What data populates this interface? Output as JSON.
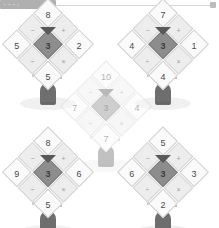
{
  "topbar": {
    "progress_label": "• • • |",
    "progress_percent": 26,
    "handle_name": "slider-handle"
  },
  "board": {
    "title": "Windmill arithmetic puzzle board",
    "operators": {
      "plus": "+",
      "minus": "−",
      "times": "×",
      "divide": "÷"
    },
    "windmills": [
      {
        "id": "windmill-top-left",
        "faded": false,
        "hub": "3",
        "arms": {
          "top_left": {
            "outer": "8",
            "inner": "+"
          },
          "top_right": {
            "outer": "2",
            "inner": "×"
          },
          "bottom_left": {
            "outer": "5",
            "inner": "−"
          },
          "bottom_right": {
            "outer": "5",
            "inner": "÷"
          }
        }
      },
      {
        "id": "windmill-top-right",
        "faded": false,
        "hub": "3",
        "arms": {
          "top_left": {
            "outer": "7",
            "inner": "+"
          },
          "top_right": {
            "outer": "1",
            "inner": "×"
          },
          "bottom_left": {
            "outer": "4",
            "inner": "−"
          },
          "bottom_right": {
            "outer": "4",
            "inner": "÷"
          }
        }
      },
      {
        "id": "windmill-middle",
        "faded": true,
        "hub": "3",
        "arms": {
          "top_left": {
            "outer": "10",
            "inner": "+"
          },
          "top_right": {
            "outer": "4",
            "inner": "×"
          },
          "bottom_left": {
            "outer": "7",
            "inner": "−"
          },
          "bottom_right": {
            "outer": "7",
            "inner": "÷"
          }
        }
      },
      {
        "id": "windmill-bottom-left",
        "faded": false,
        "hub": "3",
        "arms": {
          "top_left": {
            "outer": "8",
            "inner": "+"
          },
          "top_right": {
            "outer": "6",
            "inner": "×"
          },
          "bottom_left": {
            "outer": "9",
            "inner": "−"
          },
          "bottom_right": {
            "outer": "5",
            "inner": "÷"
          }
        }
      },
      {
        "id": "windmill-bottom-right",
        "faded": false,
        "hub": "3",
        "arms": {
          "top_left": {
            "outer": "5",
            "inner": "+"
          },
          "top_right": {
            "outer": "3",
            "inner": "×"
          },
          "bottom_left": {
            "outer": "6",
            "inner": "−"
          },
          "bottom_right": {
            "outer": "2",
            "inner": "÷"
          }
        }
      }
    ]
  },
  "colors": {
    "background": "#ffffff",
    "blade_fill": "#fafafa",
    "blade_inner_fill": "#ededed",
    "hub_fill": "#8d8d8d",
    "tower": "#6e6e6e",
    "shadow": "#f0f0f0",
    "progress": "#b0b0b0"
  }
}
